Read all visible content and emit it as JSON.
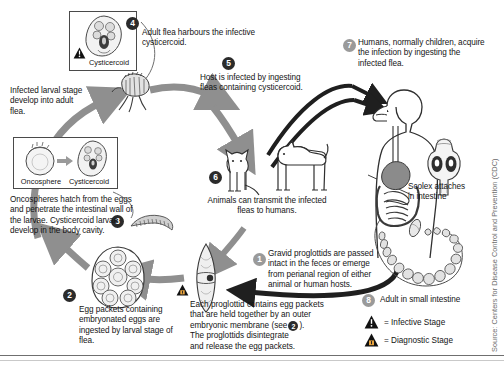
{
  "figure": {
    "source_credit": "Source: Centers for Disease Control and Prevention (CDC)"
  },
  "steps": [
    {
      "n": "1",
      "style": "grey",
      "text": "Gravid proglottids are passed intact in the feces or emerge from perianal region of either animal or human hosts."
    },
    {
      "n": "2",
      "style": "dark",
      "text": "Egg packets containing embryonated eggs are ingested by larval stage of flea."
    },
    {
      "n": "3",
      "style": "dark",
      "text": "Oncospheres hatch from the eggs and penetrate the intestinal wall of the larvae. Cysticercoid larvae develop in the body cavity."
    },
    {
      "n": "4",
      "style": "dark",
      "text": "Adult flea harbours the infective cysticercoid."
    },
    {
      "n": "5",
      "style": "dark",
      "text": "Host is infected by ingesting fleas containing cysticercoid."
    },
    {
      "n": "6",
      "style": "dark",
      "text": "Animals can transmit the infected fleas to humans."
    },
    {
      "n": "7",
      "style": "grey",
      "text": "Humans, normally children, acquire the infection by ingesting the infected flea."
    },
    {
      "n": "8",
      "style": "grey",
      "text": "Adult in small intestine"
    }
  ],
  "captions": {
    "larval_to_adult": "Infected larval stage develop into adult flea.",
    "proglottid_detail_line1": "Each proglottid contains egg packets",
    "proglottid_detail_line2": "that are held together by an outer",
    "proglottid_detail_line3_a": "embryonic membrane (see",
    "proglottid_detail_line3_b": ").",
    "proglottid_detail_line4": "The proglottids disintegrate",
    "proglottid_detail_line5": "and release the egg packets.",
    "proglottid_detail_ref": "2",
    "scolex_line1": "Scolex attaches",
    "scolex_line2": "in intestine"
  },
  "boxes": {
    "cysticercoid_box_label": "Cysticercoid",
    "oncosphere_box_label_left": "Oncosphere",
    "oncosphere_box_label_right": "Cysticercoid"
  },
  "legend": [
    {
      "icon": "infective-triangle-icon",
      "label": "= Infective Stage"
    },
    {
      "icon": "diagnostic-triangle-icon",
      "label": "= Diagnostic Stage"
    }
  ],
  "colors": {
    "arrow_grey": "#8f8f8f",
    "arrow_dark": "#1f1f1f",
    "ink": "#141414",
    "muted": "#6d6d6d",
    "paper": "#ffffff",
    "organ_grey": "#8b8b8b"
  }
}
